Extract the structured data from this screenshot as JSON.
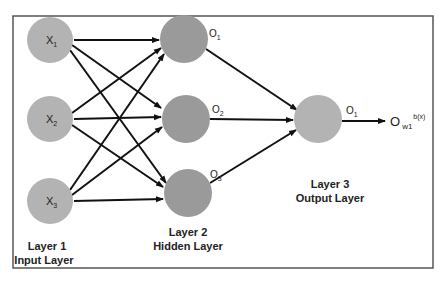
{
  "colors": {
    "input_node": "#b3b3b3",
    "hidden_node": "#9a9a9a",
    "output_node": "#b3b3b3",
    "edge": "#111111",
    "border": "#555555"
  },
  "nodes": {
    "input": [
      {
        "label": "X",
        "sub": "1"
      },
      {
        "label": "X",
        "sub": "2"
      },
      {
        "label": "X",
        "sub": "3"
      }
    ],
    "hidden": [
      {
        "label": "O",
        "sub": "1"
      },
      {
        "label": "O",
        "sub": "2"
      },
      {
        "label": "O",
        "sub": "3"
      }
    ],
    "output": {
      "label": "O",
      "sub": "1"
    }
  },
  "final_output": {
    "label": "O",
    "sub": "w1",
    "sup": "b(x)"
  },
  "layers": {
    "input": {
      "line1": "Layer 1",
      "line2": "Input Layer"
    },
    "hidden": {
      "line1": "Layer 2",
      "line2": "Hidden Layer"
    },
    "output": {
      "line1": "Layer 3",
      "line2": "Output Layer"
    }
  }
}
